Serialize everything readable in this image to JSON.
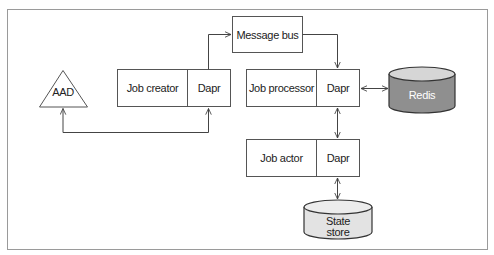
{
  "diagram": {
    "type": "architecture",
    "nodes": {
      "aad": {
        "label": "AAD",
        "shape": "triangle"
      },
      "message_bus": {
        "label": "Message bus",
        "shape": "rectangle"
      },
      "job_creator": {
        "label": "Job creator",
        "sidecar": "Dapr",
        "shape": "rectangle"
      },
      "job_processor": {
        "label": "Job processor",
        "sidecar": "Dapr",
        "shape": "rectangle"
      },
      "job_actor": {
        "label": "Job actor",
        "sidecar": "Dapr",
        "shape": "rectangle"
      },
      "redis": {
        "label": "Redis",
        "shape": "cylinder",
        "fill": "#8f8f8f",
        "top_fill": "#d6d6d6"
      },
      "state_store": {
        "label_line1": "State",
        "label_line2": "store",
        "shape": "cylinder",
        "fill": "#e3e3e3",
        "top_fill": "#ececec"
      }
    },
    "edges": [
      {
        "from": "job_creator.Dapr",
        "to": "message_bus",
        "direction": "forward"
      },
      {
        "from": "message_bus",
        "to": "job_processor.Dapr",
        "direction": "forward"
      },
      {
        "from": "job_processor.Dapr",
        "to": "redis",
        "direction": "bidirectional"
      },
      {
        "from": "job_processor.Dapr",
        "to": "job_actor.Dapr",
        "direction": "bidirectional"
      },
      {
        "from": "job_actor.Dapr",
        "to": "state_store",
        "direction": "bidirectional"
      },
      {
        "from": "aad",
        "to": "job_creator.Dapr",
        "direction": "bidirectional"
      }
    ]
  }
}
